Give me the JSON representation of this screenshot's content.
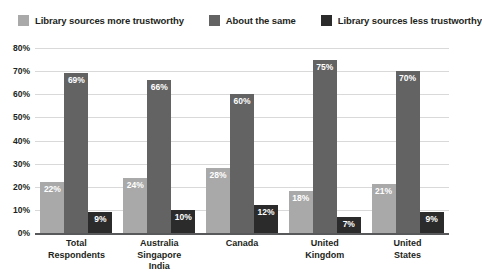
{
  "chart_data": {
    "type": "bar",
    "title": "",
    "xlabel": "",
    "ylabel": "",
    "ylim": [
      0,
      80
    ],
    "ytick_labels": [
      "80%",
      "70%",
      "60%",
      "50%",
      "40%",
      "30%",
      "20%",
      "10%",
      "0%"
    ],
    "ytick_values": [
      80,
      70,
      60,
      50,
      40,
      30,
      20,
      10,
      0
    ],
    "grid": true,
    "legend_position": "top",
    "categories": [
      "Total Respondents",
      "Australia Singapore India",
      "Canada",
      "United Kingdom",
      "United States"
    ],
    "category_lines": [
      [
        "Total",
        "Respondents"
      ],
      [
        "Australia",
        "Singapore",
        "India"
      ],
      [
        "Canada"
      ],
      [
        "United",
        "Kingdom"
      ],
      [
        "United",
        "States"
      ]
    ],
    "series": [
      {
        "name": "Library sources more trustworthy",
        "color": "#a9a9a9",
        "values": [
          22,
          24,
          28,
          18,
          21
        ],
        "labels": [
          "22%",
          "24%",
          "28%",
          "18%",
          "21%"
        ]
      },
      {
        "name": "About the same",
        "color": "#636363",
        "values": [
          69,
          66,
          60,
          75,
          70
        ],
        "labels": [
          "69%",
          "66%",
          "60%",
          "75%",
          "70%"
        ]
      },
      {
        "name": "Library sources less trustworthy",
        "color": "#2b2b2b",
        "values": [
          9,
          10,
          12,
          7,
          9
        ],
        "labels": [
          "9%",
          "10%",
          "12%",
          "7%",
          "9%"
        ]
      }
    ]
  },
  "legend": {
    "items": [
      {
        "label": "Library sources more trustworthy",
        "color": "#a9a9a9"
      },
      {
        "label": "About the same",
        "color": "#636363"
      },
      {
        "label": "Library sources less trustworthy",
        "color": "#2b2b2b"
      }
    ]
  },
  "colors": {
    "series_more_trustworthy": "#a9a9a9",
    "series_about_same": "#636363",
    "series_less_trustworthy": "#2b2b2b",
    "gridline": "#d9d9d9",
    "axis": "#58595b",
    "text": "#231f20",
    "background": "#ffffff"
  }
}
